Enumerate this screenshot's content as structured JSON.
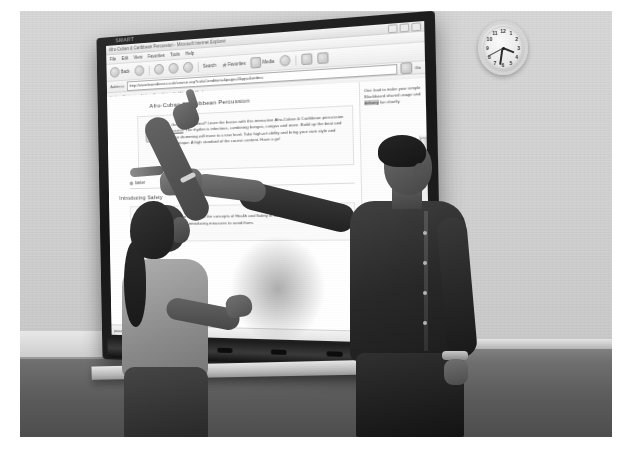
{
  "scene": {
    "description": "Two people standing at an interactive whiteboard in a classroom, both pointing at the projected browser window",
    "board_logo": "SMART"
  },
  "clock": {
    "name": "wall-clock",
    "numbers": [
      "12",
      "1",
      "2",
      "3",
      "4",
      "5",
      "6",
      "7",
      "8",
      "9",
      "10",
      "11"
    ],
    "time_shown": "3:37"
  },
  "browser": {
    "title": "Afro-Cuban & Caribbean Percussion - Microsoft Internet Explorer",
    "window_buttons": [
      "minimize",
      "maximize",
      "close"
    ],
    "menu": [
      "File",
      "Edit",
      "View",
      "Favorites",
      "Tools",
      "Help"
    ],
    "toolbar": {
      "back": "Back",
      "forward": "Forward",
      "stop": "Stop",
      "refresh": "Refresh",
      "home": "Home",
      "search": "Search",
      "favorites": "Favorites",
      "media": "Media",
      "history": "History",
      "mail": "Mail",
      "print": "Print"
    },
    "address": {
      "label": "Address",
      "value": "http://www.learndirect.co.uk/course.asp?cid=Condition=&page=2&pp=&order=",
      "go_label": "Go"
    },
    "links_bar": {
      "label": "Links",
      "items": [
        "Customise Links",
        "Free Hotmail",
        "Windows Media",
        "Windows"
      ]
    },
    "status": {
      "left": "javascript:;",
      "zone": "Internet"
    }
  },
  "page": {
    "title": "Afro-Cuban & Caribbean Percussion",
    "hero": {
      "icon": "bongo-drums-icon",
      "text_before_link": "Got a musical beat? Learn the basics with this interactive Afro-Cuban & Caribbean percussion ",
      "link_text": "course",
      "text_after_link": ". The rhythm is infectious, combining bongos, congas and more. Build up the beat and your drumming will move to a new level. Take high-art ability and bring your own style and technique. A high standard of the course content. Have a go!"
    },
    "tabs": [
      {
        "label": "taster",
        "icon": "bullet-icon"
      },
      {
        "label": "course",
        "icon": "bullet-icon"
      }
    ],
    "section_heading": "Introducing Safety",
    "card": {
      "icon": "first-aid-kit-icon",
      "text": "This course introduces the concepts of Health and Safety in the classroom, identifying potential hazards and introducing measures to avoid them."
    },
    "sidebar": {
      "text_line_1": "One lead to make your",
      "text_line_2": "simple Blackboard",
      "text_line_3": "shared usage and",
      "highlight": "delivery",
      "text_line_4": "fun shortly."
    }
  },
  "colors": {
    "wall": "#d4d4d2",
    "floor": "#5b5b59",
    "bezel": "#1c1c1a",
    "screen": "#fdfdfb",
    "link": "#3b5ea8"
  }
}
